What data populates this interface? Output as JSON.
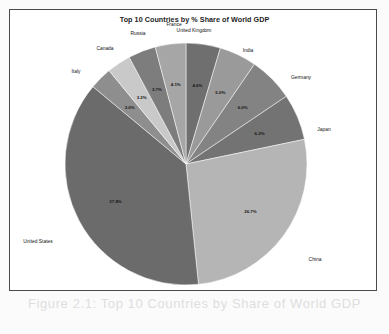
{
  "chart_data": {
    "type": "pie",
    "title": "Top 10 Countries by % Share of World GDP",
    "xlabel": "",
    "ylabel": "",
    "legend": "none",
    "grid": false,
    "categories": [
      "United Kingdom",
      "India",
      "Germany",
      "Japan",
      "China",
      "United States",
      "Italy",
      "Canada",
      "Russia",
      "France"
    ],
    "values": [
      4.6,
      5.0,
      6.0,
      6.2,
      26.7,
      37.8,
      3.0,
      3.2,
      3.7,
      4.1
    ],
    "value_labels": [
      "4.6%",
      "5.0%",
      "6.0%",
      "6.2%",
      "26.7%",
      "37.8%",
      "3.0%",
      "3.2%",
      "3.7%",
      "4.1%"
    ],
    "colors": [
      "#6f6f6f",
      "#9a9a9a",
      "#838383",
      "#737373",
      "#b5b5b5",
      "#6b6b6b",
      "#8e8e8e",
      "#c9c9c9",
      "#7d7d7d",
      "#a6a6a6"
    ],
    "start_angle_deg": -90,
    "direction": "clockwise"
  },
  "slices": [
    {
      "label": "United Kingdom",
      "pct": "4.6%"
    },
    {
      "label": "India",
      "pct": "5.0%"
    },
    {
      "label": "Germany",
      "pct": "6.0%"
    },
    {
      "label": "Japan",
      "pct": "6.2%"
    },
    {
      "label": "China",
      "pct": "26.7%"
    },
    {
      "label": "United States",
      "pct": "37.8%"
    },
    {
      "label": "Italy",
      "pct": "3.0%"
    },
    {
      "label": "Canada",
      "pct": "3.2%"
    },
    {
      "label": "Russia",
      "pct": "3.7%"
    },
    {
      "label": "France",
      "pct": "4.1%"
    }
  ],
  "page": {
    "ghost_caption": "Figure 2.1: Top 10 Countries by Share of World GDP",
    "ghost_watermark": "share of world gdp pie chart"
  }
}
